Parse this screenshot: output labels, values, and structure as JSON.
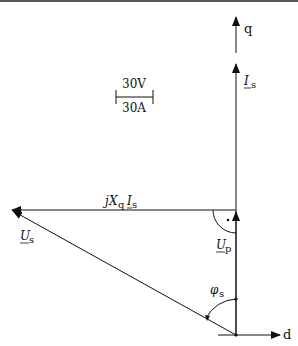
{
  "diagram": {
    "type": "phasor-diagram",
    "axes": {
      "q_label": "q",
      "d_label": "d"
    },
    "scale": {
      "voltage_label": "30V",
      "current_label": "30A"
    },
    "phasors": {
      "Is": {
        "main": "I",
        "sub": "s"
      },
      "Up": {
        "main": "U",
        "sub": "p"
      },
      "Us": {
        "main": "U",
        "sub": "s"
      },
      "jXqIs": {
        "j": "j",
        "X": "X",
        "xsub": "q",
        "I": "I",
        "isub": "s"
      }
    },
    "angle": {
      "main": "φ",
      "sub": "s"
    },
    "colors": {
      "line": "#111111",
      "background": "#ffffff"
    }
  }
}
